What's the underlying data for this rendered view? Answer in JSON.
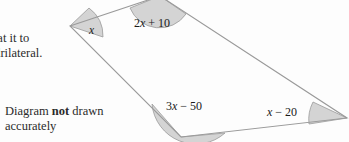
{
  "page": {
    "width": 349,
    "height": 142,
    "background_color": "#fdfdfd"
  },
  "prose": {
    "instruction_line_1": "Show that it to",
    "instruction_line_2": "is a quadrilateral.",
    "instruction_visible_1": "it to",
    "instruction_visible_2": "teral.",
    "note_line_1_prefix": "Diagram ",
    "note_line_1_emphasis": "not",
    "note_line_1_suffix": " drawn",
    "note_line_2": "accurately"
  },
  "diagram": {
    "type": "quadrilateral",
    "stroke_color": "#9a9a9a",
    "arc_fill_color": "#d4d4d4",
    "arc_stroke_color": "#9a9a9a",
    "vertices": {
      "left": {
        "x": 70,
        "y": 26
      },
      "top": {
        "x": 160,
        "y": -4
      },
      "right": {
        "x": 347,
        "y": 118
      },
      "bottom": {
        "x": 181,
        "y": 137
      }
    },
    "angles": [
      {
        "id": "left",
        "label_var": "x",
        "label_text": "x",
        "label_html": "x"
      },
      {
        "id": "top",
        "label_var": "x",
        "label_text": "2x + 10",
        "label_prefix": "2",
        "label_suffix": " + 10"
      },
      {
        "id": "bottom",
        "label_var": "x",
        "label_text": "3x − 50",
        "label_prefix": "3",
        "label_suffix": " − 50"
      },
      {
        "id": "right",
        "label_var": "x",
        "label_text": "x − 20",
        "label_prefix": "",
        "label_suffix": " − 20"
      }
    ]
  }
}
